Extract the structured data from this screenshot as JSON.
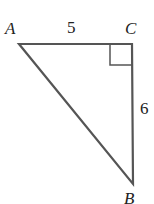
{
  "diagram": {
    "type": "right-triangle",
    "vertices": {
      "A": {
        "label": "A",
        "x": 19,
        "y": 44
      },
      "C": {
        "label": "C",
        "x": 132,
        "y": 44
      },
      "B": {
        "label": "B",
        "x": 133,
        "y": 184
      }
    },
    "sides": {
      "AC": {
        "label": "5"
      },
      "CB": {
        "label": "6"
      }
    },
    "right_angle_at": "C",
    "stroke_color": "#555555"
  }
}
